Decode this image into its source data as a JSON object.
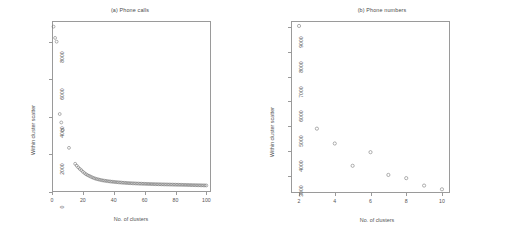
{
  "figure": {
    "width": 505,
    "height": 239,
    "background": "#ffffff",
    "point_color": "#6f6f6f",
    "axis_color": "#9a9a9a",
    "text_color": "#555555"
  },
  "panels": [
    {
      "id": "a",
      "title": "(a) Phone calls",
      "xlabel": "No. of clusters",
      "ylabel": "Within cluster scatter",
      "xticks": [
        "0",
        "20",
        "40",
        "60",
        "80",
        "100"
      ],
      "yticks": [
        "0",
        "2000",
        "4000",
        "6000",
        "8000"
      ]
    },
    {
      "id": "b",
      "title": "(b) Phone numbers",
      "xlabel": "No. of clusters",
      "ylabel": "Within cluster scatter",
      "xticks": [
        "2",
        "4",
        "6",
        "8",
        "10"
      ],
      "yticks": [
        "3000",
        "4000",
        "5000",
        "6000",
        "7000",
        "8000",
        "9000"
      ]
    }
  ],
  "chart_data": [
    {
      "type": "scatter",
      "title": "(a) Phone calls",
      "xlabel": "No. of clusters",
      "ylabel": "Within cluster scatter",
      "xlim": [
        0,
        103
      ],
      "ylim": [
        0,
        9100
      ],
      "xticks": [
        0,
        20,
        40,
        60,
        80,
        100
      ],
      "yticks": [
        0,
        2000,
        4000,
        6000,
        8000
      ],
      "grid": false,
      "legend": "none",
      "marker": "open-circle",
      "x": [
        1,
        2,
        3,
        5,
        6,
        7,
        11,
        15,
        16,
        17,
        18,
        19,
        20,
        21,
        22,
        23,
        24,
        25,
        26,
        27,
        28,
        29,
        30,
        31,
        32,
        33,
        34,
        35,
        36,
        37,
        38,
        39,
        40,
        41,
        42,
        43,
        44,
        45,
        46,
        47,
        48,
        49,
        50,
        51,
        52,
        53,
        54,
        55,
        56,
        57,
        58,
        59,
        60,
        61,
        62,
        63,
        64,
        65,
        66,
        67,
        68,
        69,
        70,
        71,
        72,
        73,
        74,
        75,
        76,
        77,
        78,
        79,
        80,
        81,
        82,
        83,
        84,
        85,
        86,
        87,
        88,
        89,
        90,
        91,
        92,
        93,
        94,
        95,
        96,
        97,
        98,
        99,
        100
      ],
      "y": [
        8800,
        8200,
        8000,
        4150,
        3700,
        3300,
        2350,
        1500,
        1400,
        1310,
        1230,
        1160,
        1080,
        1010,
        950,
        900,
        860,
        820,
        780,
        745,
        715,
        690,
        670,
        650,
        630,
        615,
        600,
        590,
        578,
        566,
        556,
        546,
        538,
        530,
        522,
        515,
        508,
        500,
        494,
        488,
        482,
        477,
        472,
        468,
        463,
        459,
        455,
        451,
        448,
        444,
        441,
        438,
        435,
        432,
        429,
        427,
        424,
        422,
        419,
        417,
        414,
        412,
        410,
        407,
        405,
        403,
        401,
        399,
        397,
        395,
        393,
        391,
        389,
        387,
        385,
        383,
        381,
        379,
        377,
        375,
        373,
        371,
        369,
        367,
        365,
        363,
        361,
        359,
        357,
        355,
        353,
        351,
        349
      ],
      "notes": "Elbow curve: very high scatter for 1-3 clusters, sharp drop through 5-11, then a long dense flattening tail with point-to-point jitter out to 100 clusters."
    },
    {
      "type": "scatter",
      "title": "(b) Phone numbers",
      "xlabel": "No. of clusters",
      "ylabel": "Within cluster scatter",
      "xlim": [
        1.55,
        10.45
      ],
      "ylim": [
        2300,
        9250
      ],
      "xticks": [
        2,
        4,
        6,
        8,
        10
      ],
      "yticks": [
        3000,
        4000,
        5000,
        6000,
        7000,
        8000,
        9000
      ],
      "grid": false,
      "legend": "none",
      "marker": "open-circle",
      "x": [
        2,
        3,
        4,
        5,
        6,
        7,
        8,
        9,
        10
      ],
      "y": [
        9050,
        4900,
        4300,
        3400,
        3950,
        3030,
        2900,
        2600,
        2450
      ],
      "notes": "Nine points, non-monotonic: large drop from k=2 to k=3, local minimum at k=5, a rise at k=6, then steady decline to k=10."
    }
  ]
}
